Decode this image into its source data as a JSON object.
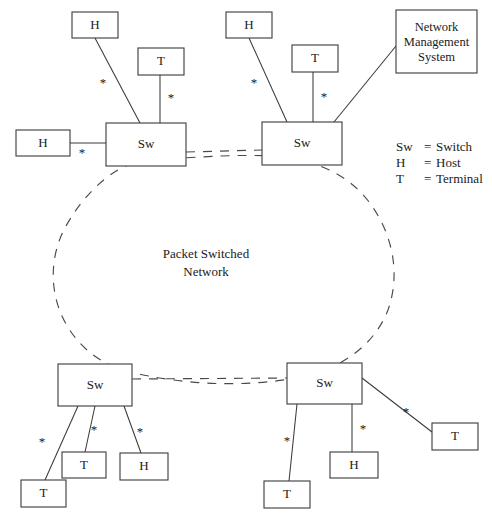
{
  "figure": {
    "kind": "network-topology-diagram",
    "background_color": "#ffffff",
    "line_color": "#3a3a3a",
    "dashed_color": "#4a4a4a",
    "text_color": "#1a1a1a"
  },
  "cloud": {
    "label_line1": "Packet Switched",
    "label_line2": "Network",
    "label_x": 206,
    "label_y": 258,
    "line_gap": 18,
    "path": "M 150 160 C 120 160 86 190 66 226 C 48 258 50 296 66 324 C 82 352 106 366 130 372 C 180 384 240 388 296 378 C 340 370 374 346 388 310 C 400 276 394 238 372 206 C 350 174 312 158 272 156 C 230 154 188 158 150 160 Z",
    "dash": "9 8"
  },
  "trunk_links": [
    {
      "id": "trunk-top",
      "from": "sw-top-left",
      "to": "sw-top-right",
      "x1": 186,
      "y1": 152,
      "x2": 262,
      "y2": 150
    },
    {
      "id": "trunk-bottom",
      "from": "sw-bottom-left",
      "to": "sw-bottom-right",
      "x1": 132,
      "y1": 379,
      "x2": 287,
      "y2": 378
    }
  ],
  "nodes": [
    {
      "id": "host-top-left",
      "type": "host",
      "label": "H",
      "x": 72,
      "y": 12,
      "w": 46,
      "h": 26
    },
    {
      "id": "terminal-top-left",
      "type": "terminal",
      "label": "T",
      "x": 138,
      "y": 48,
      "w": 46,
      "h": 27
    },
    {
      "id": "host-left",
      "type": "host",
      "label": "H",
      "x": 16,
      "y": 130,
      "w": 54,
      "h": 26
    },
    {
      "id": "sw-top-left",
      "type": "switch",
      "label": "Sw",
      "x": 106,
      "y": 123,
      "w": 80,
      "h": 43
    },
    {
      "id": "host-top-right",
      "type": "host",
      "label": "H",
      "x": 226,
      "y": 12,
      "w": 46,
      "h": 26
    },
    {
      "id": "terminal-top-right",
      "type": "terminal",
      "label": "T",
      "x": 292,
      "y": 45,
      "w": 46,
      "h": 27
    },
    {
      "id": "sw-top-right",
      "type": "switch",
      "label": "Sw",
      "x": 262,
      "y": 122,
      "w": 80,
      "h": 43
    },
    {
      "id": "nms",
      "type": "management-system",
      "label_lines": [
        "Network",
        "Management",
        "System"
      ],
      "x": 396,
      "y": 10,
      "w": 81,
      "h": 63
    },
    {
      "id": "sw-bottom-left",
      "type": "switch",
      "label": "Sw",
      "x": 58,
      "y": 364,
      "w": 74,
      "h": 42
    },
    {
      "id": "terminal-bottom-left-1",
      "type": "terminal",
      "label": "T",
      "x": 21,
      "y": 480,
      "w": 45,
      "h": 27
    },
    {
      "id": "terminal-bottom-left-2",
      "type": "terminal",
      "label": "T",
      "x": 62,
      "y": 452,
      "w": 44,
      "h": 26
    },
    {
      "id": "host-bottom-left",
      "type": "host",
      "label": "H",
      "x": 120,
      "y": 453,
      "w": 48,
      "h": 27
    },
    {
      "id": "sw-bottom-right",
      "type": "switch",
      "label": "Sw",
      "x": 287,
      "y": 363,
      "w": 75,
      "h": 41
    },
    {
      "id": "terminal-bottom-right-1",
      "type": "terminal",
      "label": "T",
      "x": 264,
      "y": 481,
      "w": 46,
      "h": 27
    },
    {
      "id": "host-bottom-right",
      "type": "host",
      "label": "H",
      "x": 330,
      "y": 452,
      "w": 48,
      "h": 26
    },
    {
      "id": "terminal-bottom-right-2",
      "type": "terminal",
      "label": "T",
      "x": 432,
      "y": 423,
      "w": 46,
      "h": 27
    }
  ],
  "links": [
    {
      "id": "link-host-top-left",
      "from": "host-top-left",
      "to": "sw-top-left",
      "x1": 95,
      "y1": 38,
      "x2": 140,
      "y2": 123,
      "star": "*",
      "star_x": 103,
      "star_y": 84
    },
    {
      "id": "link-terminal-top-left",
      "from": "terminal-top-left",
      "to": "sw-top-left",
      "x1": 160,
      "y1": 75,
      "x2": 160,
      "y2": 123,
      "star": "*",
      "star_x": 171,
      "star_y": 99
    },
    {
      "id": "link-host-left",
      "from": "host-left",
      "to": "sw-top-left",
      "x1": 70,
      "y1": 143,
      "x2": 106,
      "y2": 143,
      "star": "*",
      "star_x": 82,
      "star_y": 154
    },
    {
      "id": "link-host-top-right",
      "from": "host-top-right",
      "to": "sw-top-right",
      "x1": 249,
      "y1": 38,
      "x2": 287,
      "y2": 122,
      "star": "*",
      "star_x": 254,
      "star_y": 84
    },
    {
      "id": "link-terminal-top-right",
      "from": "terminal-top-right",
      "to": "sw-top-right",
      "x1": 313,
      "y1": 72,
      "x2": 313,
      "y2": 122,
      "star": "*",
      "star_x": 324,
      "star_y": 98
    },
    {
      "id": "link-nms",
      "from": "nms",
      "to": "sw-top-right",
      "x1": 396,
      "y1": 46,
      "x2": 334,
      "y2": 122
    },
    {
      "id": "link-terminal-bottom-left-1",
      "from": "sw-bottom-left",
      "to": "terminal-bottom-left-1",
      "x1": 78,
      "y1": 406,
      "x2": 45,
      "y2": 480,
      "star": "*",
      "star_x": 42,
      "star_y": 443
    },
    {
      "id": "link-terminal-bottom-left-2",
      "from": "sw-bottom-left",
      "to": "terminal-bottom-left-2",
      "x1": 95,
      "y1": 406,
      "x2": 85,
      "y2": 452,
      "star": "*",
      "star_x": 94,
      "star_y": 431
    },
    {
      "id": "link-host-bottom-left",
      "from": "sw-bottom-left",
      "to": "host-bottom-left",
      "x1": 124,
      "y1": 406,
      "x2": 141,
      "y2": 453,
      "star": "*",
      "star_x": 140,
      "star_y": 433
    },
    {
      "id": "link-terminal-bottom-right-1",
      "from": "sw-bottom-right",
      "to": "terminal-bottom-right-1",
      "x1": 297,
      "y1": 404,
      "x2": 289,
      "y2": 481,
      "star": "*",
      "star_x": 287,
      "star_y": 442
    },
    {
      "id": "link-host-bottom-right",
      "from": "sw-bottom-right",
      "to": "host-bottom-right",
      "x1": 352,
      "y1": 404,
      "x2": 352,
      "y2": 452,
      "star": "*",
      "star_x": 363,
      "star_y": 430
    },
    {
      "id": "link-terminal-bottom-right-2",
      "from": "sw-bottom-right",
      "to": "terminal-bottom-right-2",
      "x1": 362,
      "y1": 378,
      "x2": 432,
      "y2": 432,
      "star": "*",
      "star_x": 406,
      "star_y": 413
    }
  ],
  "legend": {
    "x_term": 396,
    "x_eq": 424,
    "x_def": 436,
    "y_start": 151,
    "line_height": 16,
    "rows": [
      {
        "term": "Sw",
        "equals": "=",
        "definition": "Switch"
      },
      {
        "term": "H",
        "equals": "=",
        "definition": "Host"
      },
      {
        "term": "T",
        "equals": "=",
        "definition": "Terminal"
      }
    ]
  }
}
